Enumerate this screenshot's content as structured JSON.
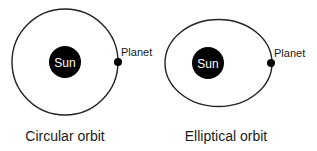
{
  "diagrams": [
    {
      "id": "circular",
      "caption": "Circular orbit",
      "sun_label": "Sun",
      "planet_label": "Planet"
    },
    {
      "id": "elliptical",
      "caption": "Elliptical orbit",
      "sun_label": "Sun",
      "planet_label": "Planet"
    }
  ],
  "colors": {
    "orbit": "#222222",
    "sun": "#000000",
    "planet": "#000000",
    "text": "#1a1a1a"
  }
}
